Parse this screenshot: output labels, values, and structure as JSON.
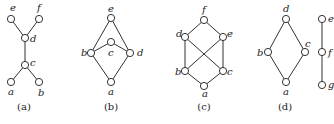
{
  "figures": [
    {
      "caption": "(a)",
      "nodes": [
        {
          "id": "e",
          "x": 11,
          "y": 19,
          "lx": 10,
          "ly": 11
        },
        {
          "id": "f",
          "x": 39,
          "y": 19,
          "lx": 37,
          "ly": 11
        },
        {
          "id": "d",
          "x": 25,
          "y": 38,
          "lx": 30,
          "ly": 42
        },
        {
          "id": "c",
          "x": 25,
          "y": 65,
          "lx": 30,
          "ly": 66
        },
        {
          "id": "a",
          "x": 11,
          "y": 82,
          "lx": 8,
          "ly": 95
        },
        {
          "id": "b",
          "x": 39,
          "y": 82,
          "lx": 38,
          "ly": 96
        }
      ],
      "edges": [
        [
          "e",
          "d"
        ],
        [
          "f",
          "d"
        ],
        [
          "d",
          "c"
        ],
        [
          "c",
          "a"
        ],
        [
          "c",
          "b"
        ]
      ],
      "cap_x": 24,
      "cap_y": 110
    },
    {
      "caption": "(b)",
      "nodes": [
        {
          "id": "e",
          "x": 111,
          "y": 18,
          "lx": 108,
          "ly": 12
        },
        {
          "id": "c",
          "x": 111,
          "y": 42,
          "lx": 108,
          "ly": 56
        },
        {
          "id": "b",
          "x": 91,
          "y": 53,
          "lx": 81,
          "ly": 56
        },
        {
          "id": "d",
          "x": 130,
          "y": 53,
          "lx": 137,
          "ly": 56
        },
        {
          "id": "a",
          "x": 111,
          "y": 82,
          "lx": 108,
          "ly": 95
        }
      ],
      "edges": [
        [
          "e",
          "b"
        ],
        [
          "e",
          "d"
        ],
        [
          "b",
          "c"
        ],
        [
          "c",
          "d"
        ],
        [
          "b",
          "a"
        ],
        [
          "d",
          "a"
        ]
      ],
      "cap_x": 111,
      "cap_y": 110
    },
    {
      "caption": "(c)",
      "nodes": [
        {
          "id": "f",
          "x": 204,
          "y": 20,
          "lx": 202,
          "ly": 13
        },
        {
          "id": "d",
          "x": 185,
          "y": 37,
          "lx": 176,
          "ly": 37
        },
        {
          "id": "e",
          "x": 223,
          "y": 37,
          "lx": 227,
          "ly": 37
        },
        {
          "id": "b",
          "x": 185,
          "y": 71,
          "lx": 175,
          "ly": 75
        },
        {
          "id": "c",
          "x": 223,
          "y": 71,
          "lx": 227,
          "ly": 75
        },
        {
          "id": "a",
          "x": 204,
          "y": 86,
          "lx": 202,
          "ly": 97
        }
      ],
      "edges": [
        [
          "f",
          "d"
        ],
        [
          "f",
          "e"
        ],
        [
          "d",
          "b"
        ],
        [
          "d",
          "c"
        ],
        [
          "e",
          "b"
        ],
        [
          "e",
          "c"
        ],
        [
          "b",
          "a"
        ],
        [
          "c",
          "a"
        ]
      ],
      "cap_x": 204,
      "cap_y": 110
    },
    {
      "caption": "(d)",
      "nodes": [
        {
          "id": "d",
          "x": 286,
          "y": 19,
          "lx": 283,
          "ly": 12
        },
        {
          "id": "b",
          "x": 268,
          "y": 52,
          "lx": 257,
          "ly": 56
        },
        {
          "id": "c",
          "x": 305,
          "y": 52,
          "lx": 305,
          "ly": 47
        },
        {
          "id": "a",
          "x": 286,
          "y": 82,
          "lx": 283,
          "ly": 95
        },
        {
          "id": "e",
          "x": 322,
          "y": 19,
          "lx": 328,
          "ly": 22
        },
        {
          "id": "f",
          "x": 322,
          "y": 52,
          "lx": 328,
          "ly": 56
        },
        {
          "id": "g",
          "x": 322,
          "y": 85,
          "lx": 328,
          "ly": 88
        }
      ],
      "edges": [
        [
          "d",
          "b"
        ],
        [
          "d",
          "c"
        ],
        [
          "b",
          "a"
        ],
        [
          "c",
          "a"
        ],
        [
          "e",
          "f"
        ],
        [
          "f",
          "g"
        ]
      ],
      "cap_x": 285,
      "cap_y": 110
    }
  ]
}
